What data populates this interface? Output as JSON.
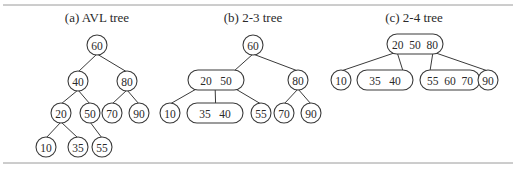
{
  "figure": {
    "panels": [
      {
        "id": "avl",
        "title": "(a) AVL tree",
        "title_pos": [
          97,
          17
        ],
        "nodes": [
          {
            "id": "n60",
            "label": "60",
            "x": 97,
            "y": 45,
            "w": 20
          },
          {
            "id": "n40",
            "label": "40",
            "x": 78,
            "y": 81,
            "w": 20
          },
          {
            "id": "n80",
            "label": "80",
            "x": 127,
            "y": 81,
            "w": 20
          },
          {
            "id": "n20",
            "label": "20",
            "x": 61,
            "y": 113,
            "w": 20
          },
          {
            "id": "n50",
            "label": "50",
            "x": 90,
            "y": 113,
            "w": 20
          },
          {
            "id": "n70",
            "label": "70",
            "x": 112,
            "y": 113,
            "w": 20
          },
          {
            "id": "n90",
            "label": "90",
            "x": 139,
            "y": 113,
            "w": 20
          },
          {
            "id": "n10",
            "label": "10",
            "x": 46,
            "y": 147,
            "w": 20
          },
          {
            "id": "n35",
            "label": "35",
            "x": 78,
            "y": 147,
            "w": 20
          },
          {
            "id": "n55",
            "label": "55",
            "x": 102,
            "y": 147,
            "w": 20
          }
        ],
        "edges": [
          [
            "n60",
            "n40"
          ],
          [
            "n60",
            "n80"
          ],
          [
            "n40",
            "n20"
          ],
          [
            "n40",
            "n50"
          ],
          [
            "n80",
            "n70"
          ],
          [
            "n80",
            "n90"
          ],
          [
            "n20",
            "n10"
          ],
          [
            "n20",
            "n35"
          ],
          [
            "n50",
            "n55"
          ]
        ]
      },
      {
        "id": "two-three",
        "title": "(b) 2-3 tree",
        "title_pos": [
          253,
          17
        ],
        "nodes": [
          {
            "id": "n60",
            "label": "60",
            "x": 253,
            "y": 45,
            "w": 20
          },
          {
            "id": "n2050",
            "label": "20   50",
            "x": 216,
            "y": 80,
            "w": 56
          },
          {
            "id": "n80",
            "label": "80",
            "x": 298,
            "y": 80,
            "w": 20
          },
          {
            "id": "n10",
            "label": "10",
            "x": 170,
            "y": 113,
            "w": 20
          },
          {
            "id": "n3540",
            "label": "35   40",
            "x": 215,
            "y": 113,
            "w": 56
          },
          {
            "id": "n55",
            "label": "55",
            "x": 261,
            "y": 113,
            "w": 20
          },
          {
            "id": "n70",
            "label": "70",
            "x": 284,
            "y": 113,
            "w": 20
          },
          {
            "id": "n90",
            "label": "90",
            "x": 311,
            "y": 113,
            "w": 20
          }
        ],
        "edges": [
          [
            "n60",
            "n2050"
          ],
          [
            "n60",
            "n80"
          ],
          [
            "n2050",
            "n10"
          ],
          [
            "n2050",
            "n3540"
          ],
          [
            "n2050",
            "n55"
          ],
          [
            "n80",
            "n70"
          ],
          [
            "n80",
            "n90"
          ]
        ]
      },
      {
        "id": "two-four",
        "title": "(c) 2-4 tree",
        "title_pos": [
          414,
          17
        ],
        "nodes": [
          {
            "id": "n205080",
            "label": "20  50  80",
            "x": 415,
            "y": 44,
            "w": 56
          },
          {
            "id": "n10",
            "label": "10",
            "x": 341,
            "y": 80,
            "w": 20
          },
          {
            "id": "n3540",
            "label": "35   40",
            "x": 385,
            "y": 80,
            "w": 56
          },
          {
            "id": "n556070",
            "label": "55  60  70",
            "x": 450,
            "y": 80,
            "w": 60
          },
          {
            "id": "n90",
            "label": "90",
            "x": 488,
            "y": 80,
            "w": 20
          }
        ],
        "edges": [
          [
            "n205080",
            "n10"
          ],
          [
            "n205080",
            "n3540"
          ],
          [
            "n205080",
            "n556070"
          ],
          [
            "n205080",
            "n90"
          ]
        ]
      }
    ],
    "colors": {
      "stroke": "#3a3a3a",
      "text": "#2a2a2a",
      "rule": "#9a9a9a",
      "background": "#ffffff"
    }
  }
}
